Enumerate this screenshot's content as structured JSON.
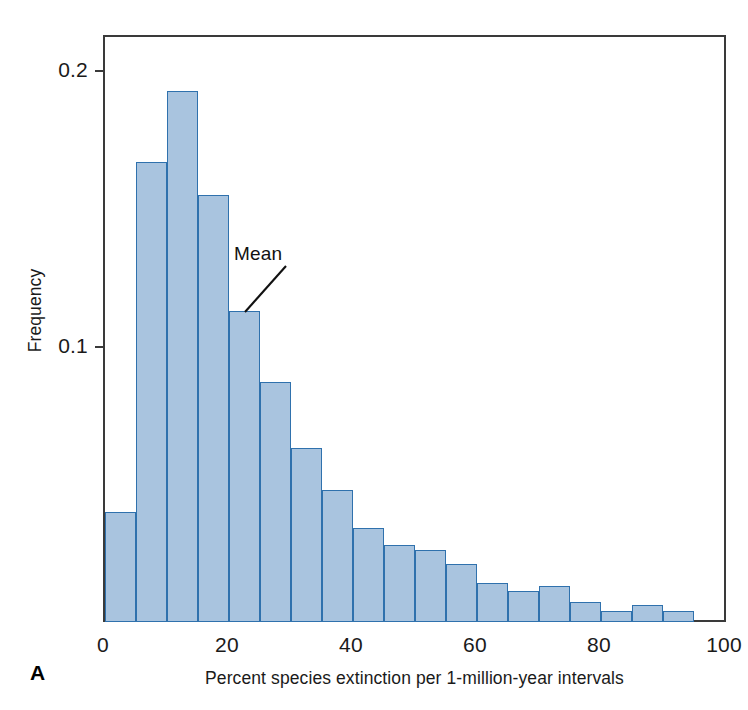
{
  "panel": {
    "label": "A"
  },
  "annotation": {
    "mean_label": "Mean"
  },
  "axes": {
    "x_title": "Percent species extinction per 1-million-year intervals",
    "y_title": "Frequency",
    "x_ticks": [
      "0",
      "20",
      "40",
      "60",
      "80",
      "100"
    ],
    "y_ticks": [
      "0.1",
      "0.2"
    ]
  },
  "colors": {
    "bar_fill": "#a9c4df",
    "bar_stroke": "#2f71ad",
    "frame": "#3a3a3a",
    "gridline": "#c9c9c9",
    "text": "#1a1a1a"
  },
  "chart_data": {
    "type": "bar",
    "title": "",
    "subtitle": "",
    "xlabel": "Percent species extinction per 1-million-year intervals",
    "ylabel": "Frequency",
    "xlim": [
      0,
      100
    ],
    "ylim": [
      0,
      0.2125
    ],
    "xticks": [
      0,
      20,
      40,
      60,
      80,
      100
    ],
    "yticks": [
      0.1,
      0.2
    ],
    "grid": true,
    "legend": null,
    "bin_width": 5,
    "bin_starts": [
      0,
      5,
      10,
      15,
      20,
      25,
      30,
      35,
      40,
      45,
      50,
      55,
      60,
      65,
      70,
      75,
      80,
      85,
      90
    ],
    "categories": [
      "0-5",
      "5-10",
      "10-15",
      "15-20",
      "20-25",
      "25-30",
      "30-35",
      "35-40",
      "40-45",
      "45-50",
      "50-55",
      "55-60",
      "60-65",
      "65-70",
      "70-75",
      "75-80",
      "80-85",
      "85-90",
      "90-95"
    ],
    "values": [
      0.04,
      0.167,
      0.193,
      0.155,
      0.113,
      0.087,
      0.063,
      0.048,
      0.034,
      0.028,
      0.026,
      0.021,
      0.014,
      0.011,
      0.013,
      0.007,
      0.004,
      0.006,
      0.004
    ],
    "annotations": [
      {
        "text": "Mean",
        "points_to_bin": "20-25",
        "points_to_x": 22.5
      }
    ]
  }
}
